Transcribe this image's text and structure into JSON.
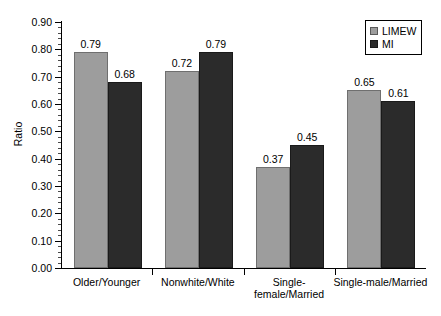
{
  "chart_data": {
    "type": "bar",
    "title": "",
    "subtitle": "",
    "xlabel": "",
    "ylabel": "Ratio",
    "ylim": [
      0.0,
      0.9
    ],
    "y_tick_step": 0.1,
    "y_minor_tick_step": 0.02,
    "grid": false,
    "legend_position": "top-right",
    "categories": [
      "Older/Younger",
      "Nonwhite/White",
      "Single-\nfemale/Married",
      "Single-male/Married"
    ],
    "y_tick_labels": [
      "0.00",
      "0.10",
      "0.20",
      "0.30",
      "0.40",
      "0.50",
      "0.60",
      "0.70",
      "0.80",
      "0.90"
    ],
    "y_tick_values": [
      0.0,
      0.1,
      0.2,
      0.3,
      0.4,
      0.5,
      0.6,
      0.7,
      0.8,
      0.9
    ],
    "series": [
      {
        "name": "LIMEW",
        "color": "#9d9d9d",
        "values": [
          0.79,
          0.72,
          0.37,
          0.65
        ],
        "labels": [
          "0.79",
          "0.72",
          "0.37",
          "0.65"
        ]
      },
      {
        "name": "MI",
        "color": "#2b2b2b",
        "values": [
          0.68,
          0.79,
          0.45,
          0.61
        ],
        "labels": [
          "0.68",
          "0.79",
          "0.45",
          "0.61"
        ]
      }
    ]
  },
  "legend": {
    "entries": [
      {
        "label": "LIMEW",
        "swatch": "limew"
      },
      {
        "label": "MI",
        "swatch": "mi"
      }
    ]
  },
  "axes": {
    "y_title": "Ratio"
  }
}
